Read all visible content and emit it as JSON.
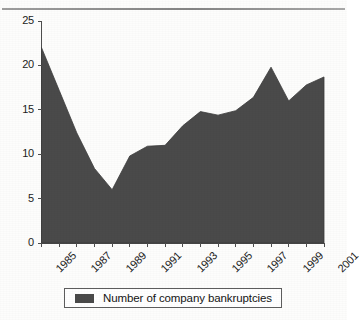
{
  "chart_data": {
    "type": "area",
    "title": "",
    "xlabel": "",
    "ylabel": "",
    "x": [
      1985,
      1986,
      1987,
      1988,
      1989,
      1990,
      1991,
      1992,
      1993,
      1994,
      1995,
      1996,
      1997,
      1998,
      1999,
      2000,
      2001
    ],
    "values": [
      22.0,
      17.2,
      12.4,
      8.4,
      6.0,
      9.8,
      10.9,
      11.0,
      13.2,
      14.8,
      14.4,
      14.9,
      16.4,
      19.8,
      16.0,
      17.8,
      18.7
    ],
    "series": [
      {
        "name": "Number of company bankruptcies",
        "values": [
          22.0,
          17.2,
          12.4,
          8.4,
          6.0,
          9.8,
          10.9,
          11.0,
          13.2,
          14.8,
          14.4,
          14.9,
          16.4,
          19.8,
          16.0,
          17.8,
          18.7
        ]
      }
    ],
    "categories": [
      "1985",
      "1986",
      "1987",
      "1988",
      "1989",
      "1990",
      "1991",
      "1992",
      "1993",
      "1994",
      "1995",
      "1996",
      "1997",
      "1998",
      "1999",
      "2000",
      "2001"
    ],
    "xtick_labels": [
      "1985",
      "1987",
      "1989",
      "1991",
      "1993",
      "1995",
      "1997",
      "1999",
      "2001"
    ],
    "xtick_values": [
      1985,
      1987,
      1989,
      1991,
      1993,
      1995,
      1997,
      1999,
      2001
    ],
    "ytick_labels": [
      "0",
      "5",
      "10",
      "15",
      "20",
      "25"
    ],
    "ytick_values": [
      0,
      5,
      10,
      15,
      20,
      25
    ],
    "ylim": [
      0,
      25
    ],
    "xlim": [
      1985,
      2001
    ],
    "grid": false,
    "legend_position": "bottom",
    "series_color": "#4a4a4a",
    "axis_color": "#4d4d4d"
  },
  "legend": {
    "label": "Number of company bankruptcies"
  },
  "axis": {
    "y_ticks": [
      "25",
      "20",
      "15",
      "10",
      "5",
      "0"
    ],
    "x_ticks": [
      "1985",
      "1987",
      "1989",
      "1991",
      "1993",
      "1995",
      "1997",
      "1999",
      "2001"
    ]
  }
}
